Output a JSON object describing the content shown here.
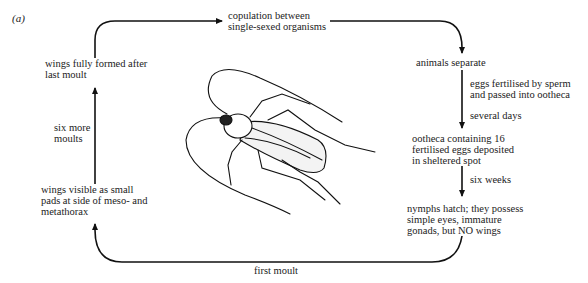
{
  "figure": {
    "panel_label": "(a)",
    "stages": {
      "copulation": [
        "copulation between",
        "single-sexed organisms"
      ],
      "separate": [
        "animals separate"
      ],
      "ootheca": [
        "ootheca containing 16",
        "fertilised eggs deposited",
        "in sheltered spot"
      ],
      "nymphs": [
        "nymphs hatch; they possess",
        "simple eyes, immature",
        "gonads, but NO wings"
      ],
      "wings_visible": [
        "wings visible as small",
        "pads at side of meso- and",
        "metathorax"
      ],
      "wings_formed": [
        "wings fully formed after",
        "last moult"
      ]
    },
    "transitions": {
      "fertilise": [
        "eggs fertilised by sperm",
        "and passed into ootheca"
      ],
      "several_days": [
        "several days"
      ],
      "six_weeks": [
        "six weeks"
      ],
      "first_moult": [
        "first moult"
      ],
      "six_more_moults": [
        "six more",
        "moults"
      ]
    },
    "illustration": "cockroach-drawing"
  }
}
